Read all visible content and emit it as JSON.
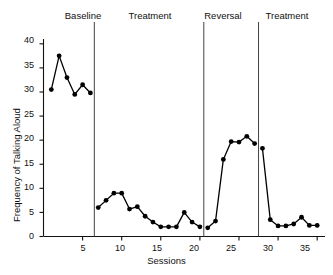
{
  "chart_data": {
    "type": "line",
    "title": "",
    "xlabel": "Sessions",
    "ylabel": "Frequency of Talking Aloud",
    "xlim": [
      0,
      36
    ],
    "ylim": [
      0,
      41
    ],
    "grid": false,
    "legend": "none",
    "x_ticks": [
      5,
      10,
      15,
      20,
      25,
      30,
      35
    ],
    "y_ticks": [
      0,
      5,
      10,
      15,
      20,
      25,
      30,
      35,
      40
    ],
    "marker": "filled-circle",
    "line_color": "#000000",
    "marker_color": "#000000",
    "x": [
      1,
      2,
      3,
      4,
      5,
      6,
      7,
      8,
      9,
      10,
      11,
      12,
      13,
      14,
      15,
      16,
      17,
      18,
      19,
      20,
      21,
      22,
      23,
      24,
      25,
      26,
      27,
      28,
      29,
      30,
      31,
      32,
      33,
      34,
      35
    ],
    "values": [
      30.5,
      37.5,
      33.0,
      29.5,
      31.5,
      29.8,
      6.0,
      7.5,
      9.0,
      9.0,
      5.7,
      6.2,
      4.2,
      3.0,
      2.0,
      2.0,
      2.0,
      5.0,
      3.0,
      2.0,
      1.8,
      3.2,
      16.0,
      19.7,
      19.6,
      20.8,
      19.3,
      18.3,
      3.5,
      2.2,
      2.2,
      2.6,
      4.0,
      2.3,
      2.3
    ],
    "phases": [
      {
        "label": "Baseline",
        "start": 1,
        "end": 6
      },
      {
        "label": "Treatment",
        "start": 7,
        "end": 20
      },
      {
        "label": "Reversal",
        "start": 21,
        "end": 27
      },
      {
        "label": "Treatment",
        "start": 28,
        "end": 35
      }
    ],
    "phase_dividers": [
      6.5,
      20.5,
      27.5
    ]
  }
}
